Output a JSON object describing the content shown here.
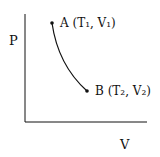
{
  "diagram": {
    "type": "PV diagram",
    "y_axis_label": "P",
    "x_axis_label": "V",
    "points": [
      {
        "id": "A",
        "label": "A (T₁, V₁)"
      },
      {
        "id": "B",
        "label": "B (T₂, V₂)"
      }
    ],
    "curve": "A to B (decreasing pressure, increasing volume)",
    "colors": {
      "ink": "#111111",
      "background": "#ffffff"
    }
  }
}
